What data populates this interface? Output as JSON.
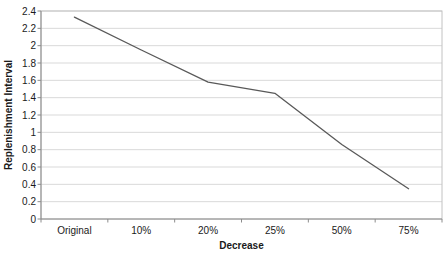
{
  "chart_data": {
    "type": "line",
    "title": "",
    "categories": [
      "Original",
      "10%",
      "20%",
      "25%",
      "50%",
      "75%"
    ],
    "values": [
      2.33,
      1.95,
      1.58,
      1.45,
      0.86,
      0.35
    ],
    "xlabel": "Decrease",
    "ylabel": "Replenishment Interval",
    "ylim": [
      0,
      2.4
    ],
    "ytick_step": 0.2,
    "ytick_labels": [
      "0",
      "0.2",
      "0.4",
      "0.6",
      "0.8",
      "1",
      "1.2",
      "1.4",
      "1.6",
      "1.8",
      "2",
      "2.2",
      "2.4"
    ],
    "grid": true,
    "legend": false,
    "colors": {
      "line": "#595959",
      "gridline": "#d9d9d9",
      "axis": "#8c8c8c",
      "plot_border": "#c2c2c2",
      "tick": "#8c8c8c",
      "text": "#1a1a1a",
      "background": "#ffffff"
    }
  }
}
